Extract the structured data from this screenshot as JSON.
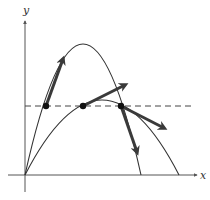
{
  "diagram": {
    "axes": {
      "x_label": "x",
      "y_label": "y",
      "origin": [
        25,
        175
      ]
    },
    "colors": {
      "curve": "#333333",
      "vector": "#3a3a3a",
      "axis": "#555555",
      "dashed": "#444444",
      "point": "#111111"
    },
    "curves": [
      {
        "name": "steep-trajectory",
        "start": [
          25,
          175
        ],
        "control": [
          83,
          -87
        ],
        "end": [
          141,
          175
        ]
      },
      {
        "name": "shallow-trajectory",
        "start": [
          25,
          175
        ],
        "control": [
          102,
          25
        ],
        "end": [
          179,
          175
        ]
      }
    ],
    "dashed_line": {
      "y": 106,
      "x1": 25,
      "x2": 195
    },
    "points": [
      {
        "name": "steep-ascending-point",
        "x": 46,
        "y": 106
      },
      {
        "name": "shallow-ascending-point",
        "x": 83,
        "y": 106
      },
      {
        "name": "intersection-descending-point",
        "x": 121,
        "y": 106
      }
    ],
    "vectors": [
      {
        "name": "steep-ascending-velocity",
        "from": [
          46,
          106
        ],
        "to": [
          64,
          56
        ]
      },
      {
        "name": "shallow-ascending-velocity",
        "from": [
          83,
          106
        ],
        "to": [
          128,
          83
        ]
      },
      {
        "name": "shallow-descending-velocity",
        "from": [
          121,
          106
        ],
        "to": [
          167,
          130
        ]
      },
      {
        "name": "steep-descending-velocity",
        "from": [
          121,
          106
        ],
        "to": [
          138,
          155
        ]
      }
    ]
  }
}
